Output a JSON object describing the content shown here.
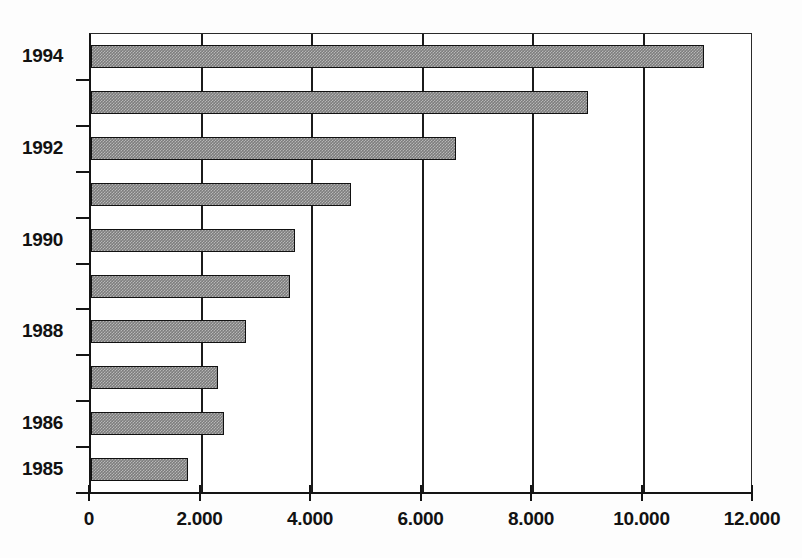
{
  "chart_data": {
    "type": "bar",
    "orientation": "horizontal",
    "title": "",
    "subtitle": "",
    "xlabel": "",
    "ylabel": "",
    "categories": [
      "1985",
      "1986",
      "1987",
      "1988",
      "1989",
      "1990",
      "1991",
      "1992",
      "1993",
      "1994"
    ],
    "values": [
      1750,
      2400,
      2300,
      2800,
      3600,
      3700,
      4700,
      6600,
      9000,
      11100
    ],
    "series": [
      {
        "name": "",
        "values": [
          1750,
          2400,
          2300,
          2800,
          3600,
          3700,
          4700,
          6600,
          9000,
          11100
        ]
      }
    ],
    "xlim": [
      0,
      12000
    ],
    "x_ticks": [
      0,
      2000,
      4000,
      6000,
      8000,
      10000,
      12000
    ],
    "x_tick_labels": [
      "0",
      "2.000",
      "4.000",
      "6.000",
      "8.000",
      "10.000",
      "12.000"
    ],
    "y_tick_labels": [
      "1985",
      "1986",
      "1988",
      "1990",
      "1992",
      "1994"
    ],
    "y_axis_labelled_categories": [
      "1985",
      "1986",
      "1988",
      "1990",
      "1992",
      "1994"
    ],
    "grid": "vertical",
    "legend": "none",
    "bar_fill_color": "#7d7d7d",
    "bar_border_color": "#111111",
    "axis_color": "#141414",
    "background_color": "#ffffff",
    "annotations": []
  },
  "axes": {
    "x_ticks": [
      {
        "label": "0",
        "value": 0
      },
      {
        "label": "2.000",
        "value": 2000
      },
      {
        "label": "4.000",
        "value": 4000
      },
      {
        "label": "6.000",
        "value": 6000
      },
      {
        "label": "8.000",
        "value": 8000
      },
      {
        "label": "10.000",
        "value": 10000
      },
      {
        "label": "12.000",
        "value": 12000
      }
    ],
    "y_labels": [
      {
        "label": "1994",
        "category": "1994"
      },
      {
        "label": "1992",
        "category": "1992"
      },
      {
        "label": "1990",
        "category": "1990"
      },
      {
        "label": "1988",
        "category": "1988"
      },
      {
        "label": "1986",
        "category": "1986"
      },
      {
        "label": "1985",
        "category": "1985"
      }
    ]
  }
}
